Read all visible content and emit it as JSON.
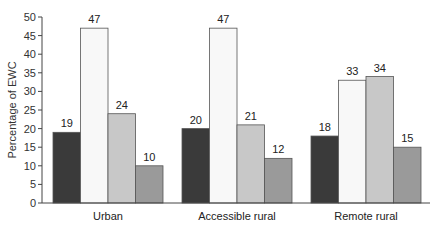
{
  "chart_data": {
    "type": "bar",
    "title": "",
    "xlabel": "",
    "ylabel": "Percentage of EWC",
    "ylim": [
      0,
      50
    ],
    "yticks": [
      0,
      5,
      10,
      15,
      20,
      25,
      30,
      35,
      40,
      45,
      50
    ],
    "grid": false,
    "legend": null,
    "categories": [
      "Urban",
      "Accessible rural",
      "Remote rural"
    ],
    "series": [
      {
        "name": "Series 1",
        "color": "#3a3a3a",
        "values": [
          19,
          20,
          18
        ]
      },
      {
        "name": "Series 2",
        "color": "#f8f8f8",
        "values": [
          47,
          47,
          33
        ]
      },
      {
        "name": "Series 3",
        "color": "#c8c8c8",
        "values": [
          24,
          21,
          34
        ]
      },
      {
        "name": "Series 4",
        "color": "#9a9a9a",
        "values": [
          10,
          12,
          15
        ]
      }
    ]
  }
}
